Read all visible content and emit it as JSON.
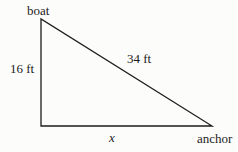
{
  "diagram": {
    "top_vertex_label": "boat",
    "bottom_right_vertex_label": "anchor",
    "vertical_side_label": "16 ft",
    "hypotenuse_label": "34 ft",
    "base_label": "x",
    "line_color": "#1c1c1c",
    "background_color": "#fcfcfa",
    "vertices": {
      "apex": [
        41,
        19
      ],
      "right_angle": [
        41,
        126
      ],
      "base_right": [
        212,
        126
      ]
    }
  }
}
